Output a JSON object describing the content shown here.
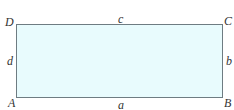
{
  "diagram": {
    "type": "rectangle",
    "fill_color": "#e8fbfd",
    "stroke_color": "#6e7c82",
    "vertices": {
      "top_left": "D",
      "top_right": "C",
      "bottom_left": "A",
      "bottom_right": "B"
    },
    "sides": {
      "bottom": "a",
      "right": "b",
      "top": "c",
      "left": "d"
    }
  }
}
